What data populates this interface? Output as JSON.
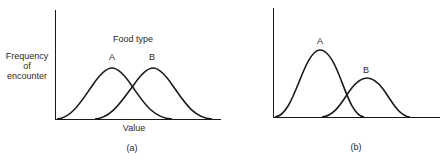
{
  "panels": [
    {
      "id": "a",
      "caption": "(a)",
      "title": "Food type",
      "ylabel_lines": [
        "Frequency",
        "of",
        "encounter"
      ],
      "xlabel": "Value",
      "curves": [
        {
          "label": "A",
          "peak_x": 112,
          "peak_y": 68,
          "start_x": 57,
          "end_x": 172
        },
        {
          "label": "B",
          "peak_x": 153,
          "peak_y": 68,
          "start_x": 95,
          "end_x": 212
        }
      ]
    },
    {
      "id": "b",
      "caption": "(b)",
      "curves": [
        {
          "label": "A",
          "peak_x": 320,
          "peak_y": 50,
          "start_x": 275,
          "end_x": 364
        },
        {
          "label": "B",
          "peak_x": 367,
          "peak_y": 78,
          "start_x": 322,
          "end_x": 410
        }
      ]
    }
  ],
  "colors": {
    "line": "#1a1a1a",
    "text": "#2a2a2a",
    "background": "#ffffff"
  }
}
